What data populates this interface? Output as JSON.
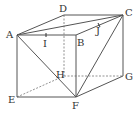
{
  "diagram": {
    "type": "3d-box-geometry",
    "vertices": {
      "A": {
        "label": "A",
        "x": 17,
        "y": 35
      },
      "B": {
        "label": "B",
        "x": 76,
        "y": 35
      },
      "C": {
        "label": "C",
        "x": 123,
        "y": 15
      },
      "D": {
        "label": "D",
        "x": 64,
        "y": 15
      },
      "E": {
        "label": "E",
        "x": 17,
        "y": 97
      },
      "F": {
        "label": "F",
        "x": 76,
        "y": 97
      },
      "G": {
        "label": "G",
        "x": 123,
        "y": 76
      },
      "H": {
        "label": "H",
        "x": 64,
        "y": 76
      }
    },
    "points": {
      "I": {
        "label": "I",
        "on": "AB",
        "x": 46,
        "y": 35
      },
      "J": {
        "label": "J",
        "on": "BC",
        "x": 99,
        "y": 25
      }
    },
    "solid_edges": [
      "AB",
      "BC",
      "CD",
      "DA",
      "AE",
      "BF",
      "CG",
      "EF",
      "FG",
      "AC",
      "AF",
      "CF"
    ],
    "hidden_edges": [
      "DH",
      "EH",
      "HG"
    ],
    "colors": {
      "line": "#555555",
      "text": "#333333"
    }
  }
}
